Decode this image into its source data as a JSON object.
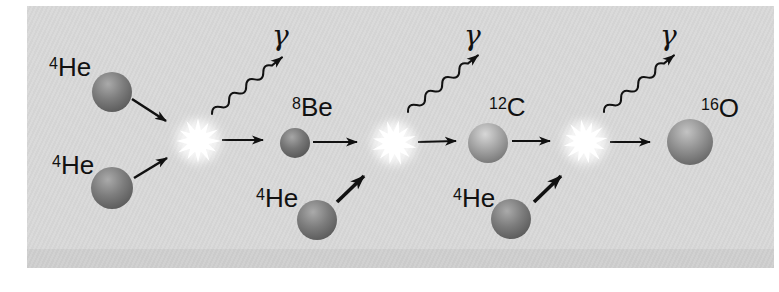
{
  "figure": {
    "background_color": "#d8d8d8",
    "label_color": "#111111",
    "particles": [
      {
        "id": "helium-top-left",
        "mass": "4",
        "symbol": "He"
      },
      {
        "id": "helium-bottom-left",
        "mass": "4",
        "symbol": "He"
      },
      {
        "id": "beryllium",
        "mass": "8",
        "symbol": "Be"
      },
      {
        "id": "helium-middle",
        "mass": "4",
        "symbol": "He"
      },
      {
        "id": "carbon",
        "mass": "12",
        "symbol": "C"
      },
      {
        "id": "helium-right",
        "mass": "4",
        "symbol": "He"
      },
      {
        "id": "oxygen",
        "mass": "16",
        "symbol": "O"
      }
    ],
    "gammas": [
      "γ",
      "γ",
      "γ"
    ],
    "sphere_colors": {
      "helium": "#7d7d7d",
      "beryllium": "#767676",
      "carbon": "#a2a2a2",
      "oxygen": "#8f8f8f"
    },
    "flash_color": "#ffffff"
  }
}
